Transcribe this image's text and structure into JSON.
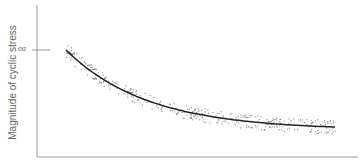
{
  "chart_data": {
    "type": "scatter",
    "title": "",
    "xlabel": "",
    "ylabel": "Magnitude of cyclic stress",
    "y_tick_labels": [
      "σa"
    ],
    "grid": false,
    "legend": "none",
    "series": [
      {
        "name": "measured data",
        "kind": "scatter",
        "description": "scattered points around a decaying curve"
      },
      {
        "name": "fitted curve",
        "kind": "line",
        "x": [
          0,
          0.1,
          0.2,
          0.3,
          0.4,
          0.5,
          0.6,
          0.7,
          0.8,
          0.9,
          1.0
        ],
        "y": [
          1.0,
          0.78,
          0.6,
          0.47,
          0.36,
          0.28,
          0.21,
          0.16,
          0.12,
          0.1,
          0.09
        ]
      }
    ],
    "xlim": [
      0,
      1.2
    ],
    "ylim": [
      -0.35,
      1.55
    ]
  },
  "labels": {
    "ylabel": "Magnitude of cyclic stress",
    "tick_sigma": "σa"
  },
  "colors": {
    "axis": "#888888",
    "curve": "#222222",
    "points": "#777777"
  }
}
